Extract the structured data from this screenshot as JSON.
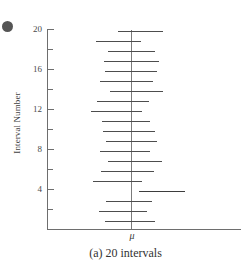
{
  "figure": {
    "caption": "(a) 20 intervals",
    "corner_marker": "bullet-dot",
    "mu_symbol": "μ"
  },
  "chart_data": {
    "type": "bar",
    "orientation": "horizontal",
    "title": "(a) 20 intervals",
    "subtitle": "",
    "xlabel": "",
    "ylabel": "Interval Number",
    "grid": false,
    "legend": null,
    "ylim": [
      0,
      20
    ],
    "y_ticks_major": [
      4,
      8,
      12,
      16,
      20
    ],
    "y_ticks_minor": [
      2,
      6,
      10,
      14,
      18
    ],
    "y_tick_labels": [
      "4",
      "8",
      "12",
      "16",
      "20"
    ],
    "reference_line": {
      "label": "μ",
      "value": 0,
      "orientation": "vertical"
    },
    "categories": [
      1,
      2,
      3,
      4,
      5,
      6,
      7,
      8,
      9,
      10,
      11,
      12,
      13,
      14,
      15,
      16,
      17,
      18,
      19,
      20
    ],
    "intervals": [
      {
        "n": 1,
        "lower": -0.55,
        "upper": 0.48,
        "covers_mu": true
      },
      {
        "n": 2,
        "lower": -0.69,
        "upper": 0.31,
        "covers_mu": true
      },
      {
        "n": 3,
        "lower": -0.52,
        "upper": 0.4,
        "covers_mu": true
      },
      {
        "n": 4,
        "lower": 0.17,
        "upper": 1.12,
        "covers_mu": false
      },
      {
        "n": 5,
        "lower": -0.95,
        "upper": 0.05,
        "covers_mu": true
      },
      {
        "n": 6,
        "lower": -0.69,
        "upper": 0.33,
        "covers_mu": true
      },
      {
        "n": 7,
        "lower": -0.62,
        "upper": 0.45,
        "covers_mu": true
      },
      {
        "n": 8,
        "lower": -0.83,
        "upper": 0.19,
        "covers_mu": true
      },
      {
        "n": 9,
        "lower": -0.74,
        "upper": 0.31,
        "covers_mu": true
      },
      {
        "n": 10,
        "lower": -0.76,
        "upper": 0.33,
        "covers_mu": true
      },
      {
        "n": 11,
        "lower": -0.93,
        "upper": 0.12,
        "covers_mu": true
      },
      {
        "n": 12,
        "lower": -1.0,
        "upper": 0.0,
        "covers_mu": true
      },
      {
        "n": 13,
        "lower": -0.79,
        "upper": 0.21,
        "covers_mu": true
      },
      {
        "n": 14,
        "lower": -0.62,
        "upper": 0.43,
        "covers_mu": true
      },
      {
        "n": 15,
        "lower": -0.69,
        "upper": 0.4,
        "covers_mu": true
      },
      {
        "n": 16,
        "lower": -0.62,
        "upper": 0.33,
        "covers_mu": true
      },
      {
        "n": 17,
        "lower": -0.74,
        "upper": 0.31,
        "covers_mu": true
      },
      {
        "n": 18,
        "lower": -0.55,
        "upper": 0.38,
        "covers_mu": true
      },
      {
        "n": 19,
        "lower": -0.83,
        "upper": 0.21,
        "covers_mu": true
      },
      {
        "n": 20,
        "lower": -0.31,
        "upper": 0.74,
        "covers_mu": true
      }
    ],
    "pixel_geometry": {
      "note": "Drawing coordinates used to reproduce the original raster.",
      "x_axis_y": 229,
      "x_axis_left": 47,
      "x_axis_right": 241,
      "y_axis_x": 47,
      "y_axis_top": 29,
      "mu_x": 131,
      "unit_px_per_interval": 10,
      "bars": [
        {
          "n": 20,
          "left": 118,
          "right": 163,
          "y": 31
        },
        {
          "n": 19,
          "left": 96,
          "right": 141,
          "y": 41
        },
        {
          "n": 18,
          "left": 108,
          "right": 155,
          "y": 51
        },
        {
          "n": 17,
          "left": 104,
          "right": 159,
          "y": 61
        },
        {
          "n": 16,
          "left": 105,
          "right": 157,
          "y": 71
        },
        {
          "n": 15,
          "left": 100,
          "right": 153,
          "y": 81
        },
        {
          "n": 14,
          "left": 110,
          "right": 163,
          "y": 91
        },
        {
          "n": 13,
          "left": 97,
          "right": 149,
          "y": 101
        },
        {
          "n": 12,
          "left": 91,
          "right": 142,
          "y": 111
        },
        {
          "n": 11,
          "left": 102,
          "right": 150,
          "y": 121
        },
        {
          "n": 10,
          "left": 103,
          "right": 155,
          "y": 131
        },
        {
          "n": 9,
          "left": 106,
          "right": 157,
          "y": 141
        },
        {
          "n": 8,
          "left": 100,
          "right": 150,
          "y": 151
        },
        {
          "n": 7,
          "left": 108,
          "right": 162,
          "y": 161
        },
        {
          "n": 6,
          "left": 101,
          "right": 154,
          "y": 171
        },
        {
          "n": 5,
          "left": 93,
          "right": 142,
          "y": 181
        },
        {
          "n": 4,
          "left": 139,
          "right": 185,
          "y": 191
        },
        {
          "n": 3,
          "left": 106,
          "right": 152,
          "y": 201
        },
        {
          "n": 2,
          "left": 99,
          "right": 147,
          "y": 211
        },
        {
          "n": 1,
          "left": 105,
          "right": 155,
          "y": 221
        }
      ]
    }
  },
  "colors": {
    "axis": "#6e6e6e",
    "interval": "#4d4d4d",
    "text": "#3a3a3a",
    "background": "#ffffff"
  }
}
